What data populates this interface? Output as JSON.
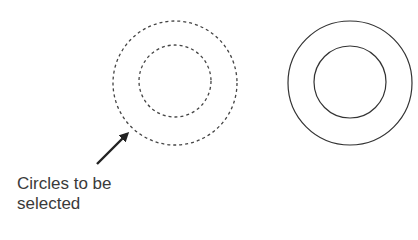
{
  "diagram": {
    "left_group": {
      "style": "dashed",
      "state": "selected",
      "outer_circle": {
        "cx": 175,
        "cy": 83,
        "r": 62
      },
      "inner_circle": {
        "cx": 175,
        "cy": 81,
        "r": 36
      }
    },
    "right_group": {
      "style": "solid",
      "state": "unselected",
      "outer_circle": {
        "cx": 350,
        "cy": 83,
        "r": 62
      },
      "inner_circle": {
        "cx": 350,
        "cy": 82,
        "r": 36
      }
    },
    "arrow": {
      "from": [
        97,
        164
      ],
      "to": [
        129,
        132
      ],
      "icon": "arrow-up-right-icon"
    },
    "annotation": {
      "line1": "Circles to be",
      "line2": "selected"
    },
    "colors": {
      "stroke": "#333333",
      "text": "#3a3a3a",
      "background": "#ffffff"
    }
  }
}
